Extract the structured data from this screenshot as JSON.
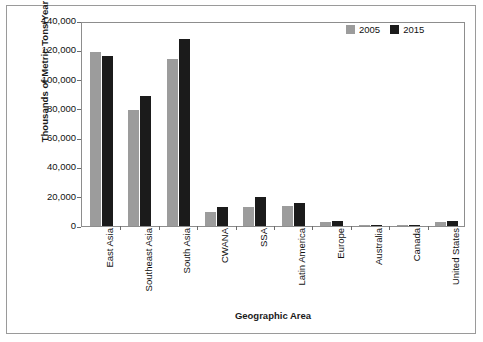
{
  "chart_data": {
    "type": "bar",
    "title": "",
    "xlabel": "Geographic Area",
    "ylabel": "Thousands of Metric Tons/Year",
    "categories": [
      "East Asia",
      "Southeast Asia",
      "South Asia",
      "CWANA",
      "SSA",
      "Latin America",
      "Europe",
      "Australia",
      "Canada",
      "United States"
    ],
    "series": [
      {
        "name": "2005",
        "color": "#9c9c9c",
        "values": [
          119000,
          79500,
          114000,
          9500,
          13000,
          13500,
          2500,
          300,
          200,
          3000
        ]
      },
      {
        "name": "2015",
        "color": "#1b1b1b",
        "values": [
          116000,
          88500,
          128000,
          13000,
          20000,
          15500,
          3500,
          400,
          300,
          3500
        ]
      }
    ],
    "ylim": [
      0,
      140000
    ],
    "yticks": [
      0,
      20000,
      40000,
      60000,
      80000,
      100000,
      120000,
      140000
    ],
    "ytick_labels": [
      "0",
      "20,000",
      "40,000",
      "60,000",
      "80,000",
      "100,000",
      "120,000",
      "140,000"
    ],
    "grid": false,
    "legend_position": "top-right",
    "legend_entries": [
      "2005",
      "2015"
    ]
  }
}
